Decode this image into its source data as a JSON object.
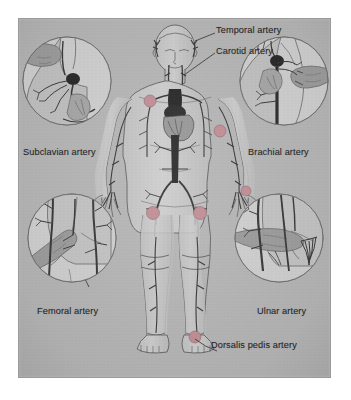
{
  "figure": {
    "background_color": "#ffffff",
    "panel_color": "#b8b8b8",
    "panel_border_color": "#9a9a9a",
    "artery_color": "#3a3a3a",
    "pulse_point_color": "#c49098",
    "skin_color": "#c9c9c9",
    "inset_fill_color": "#d2d2d2",
    "label_color": "#1e1e1e",
    "leader_line_color": "#2e2e2e"
  },
  "labels": {
    "temporal": "Temporal artery",
    "carotid": "Carotid artery",
    "subclavian": "Subclavian artery",
    "brachial": "Brachial artery",
    "femoral": "Femoral artery",
    "ulnar": "Ulnar artery",
    "dorsalis_pedis": "Dorsalis pedis artery"
  },
  "insets": [
    {
      "id": "subclavian",
      "label": "Subclavian artery",
      "position": "top-left"
    },
    {
      "id": "brachial",
      "label": "Brachial artery",
      "position": "top-right"
    },
    {
      "id": "femoral",
      "label": "Femoral artery",
      "position": "bottom-left"
    },
    {
      "id": "ulnar",
      "label": "Ulnar artery",
      "position": "bottom-right"
    }
  ],
  "pulse_points": [
    {
      "name": "temporal",
      "side": "both"
    },
    {
      "name": "carotid",
      "side": "both"
    },
    {
      "name": "subclavian",
      "side": "left"
    },
    {
      "name": "brachial",
      "side": "right"
    },
    {
      "name": "femoral",
      "side": "both"
    },
    {
      "name": "dorsalis-pedis",
      "side": "right"
    }
  ]
}
